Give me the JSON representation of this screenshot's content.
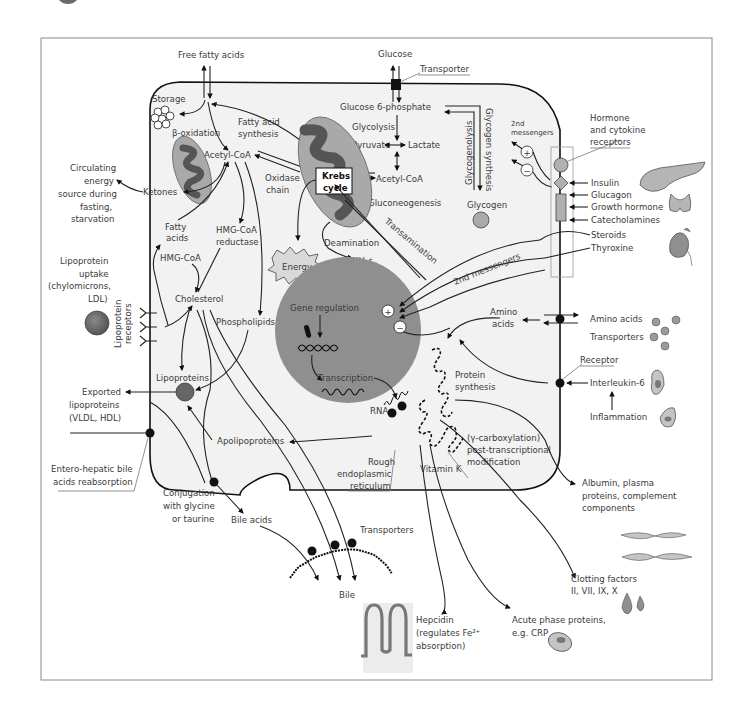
{
  "figure": {
    "frame_color": "#8a8a8a",
    "cell_fill": "#f2f2f2",
    "nucleus_fill": "#8f8f8f",
    "mito_fill": "#a9a9a9",
    "mito_inner_fill": "#555555",
    "organ_fill": "#b5b5b5"
  },
  "top": {
    "free_fatty_acids": "Free fatty acids",
    "glucose": "Glucose",
    "transporter": "Transporter"
  },
  "lipid": {
    "storage": "Storage",
    "beta_oxidation": "β-oxidation",
    "fatty_acid_synthesis_1": "Fatty acid",
    "fatty_acid_synthesis_2": "synthesis",
    "acetyl_coa_left": "Acetyl-CoA",
    "ketones": "Ketones",
    "fatty_acids_1": "Fatty",
    "fatty_acids_2": "acids",
    "hmg_coa_reductase_1": "HMG-CoA",
    "hmg_coa_reductase_2": "reductase",
    "hmg_coa": "HMG-CoA",
    "cholesterol": "Cholesterol",
    "phospholipids": "Phospholipids",
    "lipoproteins": "Lipoproteins",
    "apolipoproteins": "Apolipoproteins",
    "conjugation_1": "Conjugation",
    "conjugation_2": "with glycine",
    "conjugation_3": "or taurine",
    "bile_acids": "Bile acids",
    "transporters_bottom": "Transporters",
    "bile": "Bile"
  },
  "carb": {
    "glucose_6_phosphate": "Glucose 6-phosphate",
    "glycolysis": "Glycolysis",
    "pyruvate": "Pyruvate",
    "lactate": "Lactate",
    "acetyl_coa_right": "Acetyl-CoA",
    "gluconeogenesis": "Gluconeogenesis",
    "glycogenolysis": "Glycogenolysis",
    "glycogen_synthesis": "Glycogen synthesis",
    "glycogen": "Glycogen"
  },
  "mito": {
    "krebs_1": "Krebs",
    "krebs_2": "cycle",
    "oxidase_1": "Oxidase",
    "oxidase_2": "chain",
    "energy": "Energy",
    "deamination": "Deamination",
    "nh4": "NH₄⁺",
    "transamination": "Transamination"
  },
  "nucleus": {
    "gene_regulation": "Gene regulation",
    "transcription": "Transcription",
    "plus": "+",
    "minus": "−",
    "second_messengers": "2nd messengers"
  },
  "protein": {
    "amino_acids_inner_1": "Amino",
    "amino_acids_inner_2": "acids",
    "protein_synthesis_1": "Protein",
    "protein_synthesis_2": "synthesis",
    "rna": "RNA",
    "rer_1": "Rough",
    "rer_2": "endoplasmic",
    "rer_3": "reticulum",
    "gamma_1": "(γ-carboxylation)",
    "gamma_2": "post-transcriptional",
    "gamma_3": "modification",
    "vitamin_k": "Vitamin K"
  },
  "left_outside": {
    "circulating_1": "Circulating",
    "circulating_2": "energy",
    "circulating_3": "source during",
    "circulating_4": "fasting,",
    "circulating_5": "starvation",
    "lipo_uptake_1": "Lipoprotein",
    "lipo_uptake_2": "uptake",
    "lipo_uptake_3": "(chylomicrons,",
    "lipo_uptake_4": "LDL)",
    "lipo_receptors_1": "Lipoprotein",
    "lipo_receptors_2": "receptors",
    "exported_1": "Exported",
    "exported_2": "lipoproteins",
    "exported_3": "(VLDL, HDL)",
    "enterohepatic_1": "Entero-hepatic bile",
    "enterohepatic_2": "acids reabsorption"
  },
  "right_outside": {
    "second_msg_small_1": "2nd",
    "second_msg_small_2": "messengers",
    "hormone_1": "Hormone",
    "hormone_2": "and cytokine",
    "hormone_3": "receptors",
    "insulin": "Insulin",
    "glucagon": "Glucagon",
    "growth_hormone": "Growth hormone",
    "catecholamines": "Catecholamines",
    "steroids": "Steroids",
    "thyroxine": "Thyroxine",
    "amino_acids": "Amino acids",
    "transporters": "Transporters",
    "receptor": "Receptor",
    "interleukin": "Interleukin-6",
    "inflammation": "Inflammation",
    "albumin_1": "Albumin, plasma",
    "albumin_2": "proteins, complement",
    "albumin_3": "components",
    "clotting_1": "Clotting factors",
    "clotting_2": "II, VII, IX, X"
  },
  "bottom_outside": {
    "hepcidin_1": "Hepcidin",
    "hepcidin_2": "(regulates Fe²⁺",
    "hepcidin_3": "absorption)",
    "acute_1": "Acute phase proteins,",
    "acute_2": "e.g. CRP"
  }
}
